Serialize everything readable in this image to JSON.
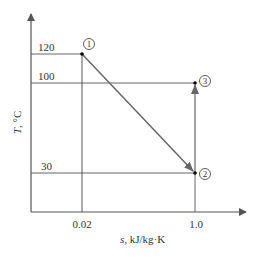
{
  "diagram": {
    "type": "T-s diagram",
    "y_axis": {
      "symbol": "T",
      "unit": ", °C",
      "ticks": [
        "120",
        "100",
        "30"
      ]
    },
    "x_axis": {
      "symbol": "s",
      "unit": ", kJ/kg·K",
      "ticks": [
        "0.02",
        "1.0"
      ]
    },
    "states": [
      {
        "id": "1",
        "label": "1",
        "s": 0.02,
        "T": 120
      },
      {
        "id": "2",
        "label": "2",
        "s": 1.0,
        "T": 30
      },
      {
        "id": "3",
        "label": "3",
        "s": 1.0,
        "T": 100
      }
    ],
    "processes": [
      {
        "from": "1",
        "to": "2",
        "arrow": true
      },
      {
        "from": "2",
        "to": "3",
        "arrow": true
      }
    ],
    "colors": {
      "axis": "#555555",
      "guide": "#666666",
      "process": "#666666",
      "point": "#000000"
    }
  }
}
